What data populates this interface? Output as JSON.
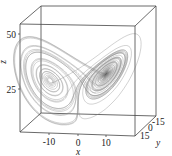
{
  "chart_data": {
    "type": "line",
    "subtype": "3d-trajectory",
    "title": "",
    "xlabel": "x",
    "ylabel": "y",
    "zlabel": "z",
    "x_ticks": [
      "-10",
      "0",
      "10"
    ],
    "y_ticks": [
      "-15",
      "0",
      "15"
    ],
    "z_ticks": [
      "25",
      "50"
    ],
    "xlim": [
      -20,
      20
    ],
    "ylim": [
      -25,
      25
    ],
    "zlim": [
      0,
      55
    ],
    "grid": false,
    "line_color": "#8a8a8a",
    "lorenz_params": {
      "sigma": 10,
      "rho": 28,
      "beta": 2.6667
    }
  }
}
